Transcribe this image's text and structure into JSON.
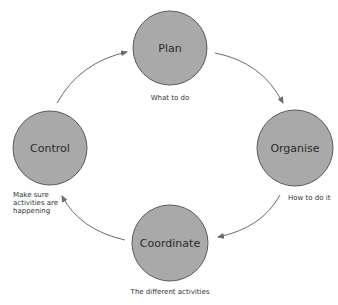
{
  "diagram": {
    "type": "cycle",
    "colors": {
      "node_fill": "#a9a9a9",
      "node_stroke": "#5a5a5a",
      "arrow": "#6a6a6a",
      "text": "#2a2a2a"
    },
    "nodes": [
      {
        "id": "plan",
        "label": "Plan",
        "caption": [
          "What to do"
        ]
      },
      {
        "id": "organise",
        "label": "Organise",
        "caption": [
          "How to do it"
        ]
      },
      {
        "id": "coordinate",
        "label": "Coordinate",
        "caption": [
          "The different activities"
        ]
      },
      {
        "id": "control",
        "label": "Control",
        "caption": [
          "Make sure",
          "activities are",
          "happening"
        ]
      }
    ],
    "edges": [
      {
        "from": "control",
        "to": "plan"
      },
      {
        "from": "plan",
        "to": "organise"
      },
      {
        "from": "organise",
        "to": "coordinate"
      },
      {
        "from": "coordinate",
        "to": "control"
      }
    ]
  }
}
